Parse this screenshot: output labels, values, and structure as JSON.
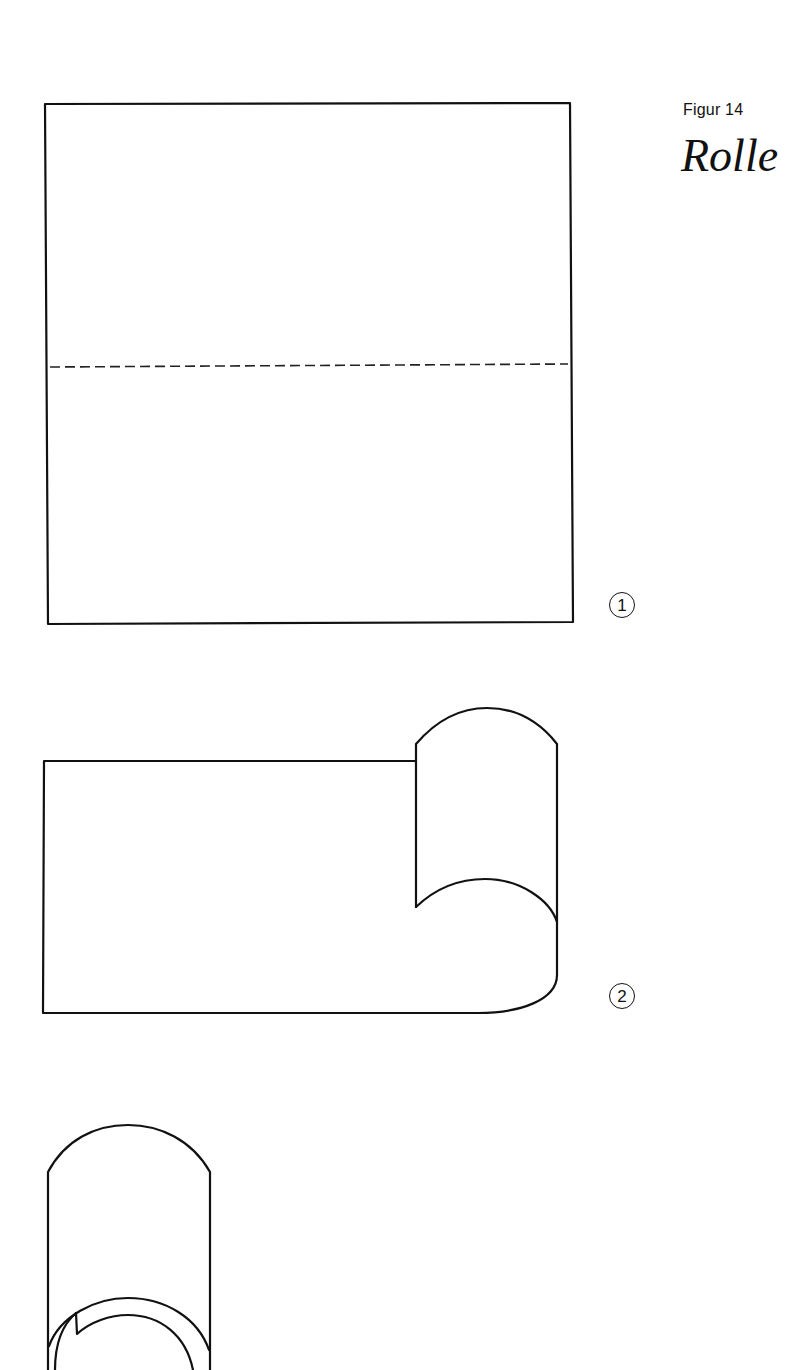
{
  "figure": {
    "label": "Figur 14",
    "title": "Rolle"
  },
  "steps": [
    {
      "number": "1",
      "description": "Square sheet with dashed horizontal fold line"
    },
    {
      "number": "2",
      "description": "Sheet being rolled from the right edge"
    },
    {
      "number": "3",
      "description": "Completed roll (cylinder)"
    }
  ],
  "colors": {
    "line": "#111111",
    "background": "#ffffff"
  }
}
